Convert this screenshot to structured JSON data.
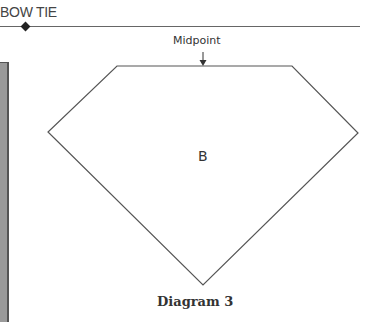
{
  "header": {
    "title": "BOW TIE"
  },
  "diagram": {
    "shape_name": "diamond-pentagon",
    "region_label": "B",
    "midpoint_label": "Midpoint",
    "caption": "Diagram 3",
    "vertices": {
      "top_left": [
        117,
        66
      ],
      "top_right": [
        292,
        66
      ],
      "right": [
        358,
        133
      ],
      "bottom": [
        203,
        285
      ],
      "left": [
        48,
        132
      ]
    },
    "midpoint_arrow": {
      "x": 203,
      "y_start": 52,
      "y_end": 66
    }
  },
  "colors": {
    "line": "#555555",
    "text": "#333333",
    "side_bar": "#9a9a9a",
    "side_bar_border": "#555555",
    "marker": "#222222"
  }
}
